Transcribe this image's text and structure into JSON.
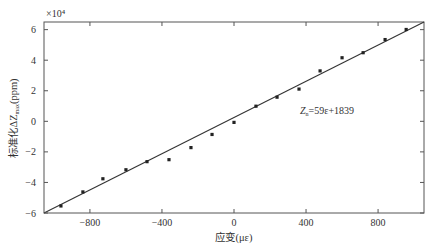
{
  "chart_data": {
    "type": "scatter",
    "title": "",
    "xlabel": "应变(με)",
    "ylabel": "标准化ΔZ_max(ppm)",
    "ylabel_parts": {
      "prefix": "标准化ΔZ",
      "sub": "max",
      "suffix": "(ppm)"
    },
    "y_multiplier": "×10⁴",
    "xlim": [
      -1055,
      1055
    ],
    "ylim": [
      -6,
      6.5
    ],
    "xticks": [
      -800,
      -400,
      0,
      400,
      800
    ],
    "yticks": [
      -6,
      -4,
      -2,
      0,
      2,
      4,
      6
    ],
    "grid": false,
    "legend": "none",
    "series": [
      {
        "name": "measured",
        "style": "markers",
        "x": [
          -961,
          -839,
          -728,
          -600,
          -483,
          -361,
          -239,
          -122,
          0,
          122,
          239,
          361,
          478,
          600,
          717,
          839,
          956
        ],
        "y": [
          -5.54,
          -4.62,
          -3.76,
          -3.17,
          -2.64,
          -2.51,
          -1.72,
          -0.86,
          -0.07,
          0.99,
          1.58,
          2.11,
          3.3,
          4.16,
          4.49,
          5.35,
          6.01
        ]
      },
      {
        "name": "fit",
        "style": "line",
        "x": [
          -1055,
          1055
        ],
        "y": [
          -6.0,
          6.5
        ]
      }
    ],
    "annotations": [
      {
        "text_main": "Z",
        "text_sub": "n",
        "text_rest": "=59ε+1839",
        "x": 400,
        "y": 0.8
      }
    ]
  }
}
